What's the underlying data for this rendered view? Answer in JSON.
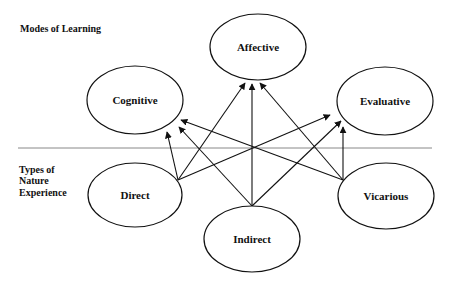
{
  "sections": {
    "top_label": "Modes of Learning",
    "bottom_label_lines": [
      "Types of",
      "Nature",
      "Experience"
    ]
  },
  "modes_of_learning": [
    {
      "id": "affective",
      "label": "Affective"
    },
    {
      "id": "cognitive",
      "label": "Cognitive"
    },
    {
      "id": "evaluative",
      "label": "Evaluative"
    }
  ],
  "types_of_experience": [
    {
      "id": "direct",
      "label": "Direct"
    },
    {
      "id": "indirect",
      "label": "Indirect"
    },
    {
      "id": "vicarious",
      "label": "Vicarious"
    }
  ],
  "edges": [
    {
      "from": "direct",
      "to": "cognitive"
    },
    {
      "from": "direct",
      "to": "affective"
    },
    {
      "from": "direct",
      "to": "evaluative"
    },
    {
      "from": "indirect",
      "to": "cognitive"
    },
    {
      "from": "indirect",
      "to": "affective"
    },
    {
      "from": "indirect",
      "to": "evaluative"
    },
    {
      "from": "vicarious",
      "to": "cognitive"
    },
    {
      "from": "vicarious",
      "to": "affective"
    },
    {
      "from": "vicarious",
      "to": "evaluative"
    }
  ],
  "colors": {
    "stroke": "#111111",
    "divider": "#888888",
    "background": "#ffffff"
  }
}
